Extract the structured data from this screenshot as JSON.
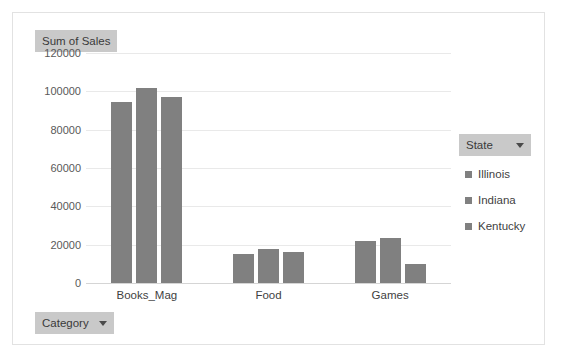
{
  "value_field": {
    "label": "Sum of Sales"
  },
  "category_field": {
    "label": "Category",
    "icon": "chevron-down-icon"
  },
  "legend_field": {
    "label": "State",
    "icon": "chevron-down-icon"
  },
  "colors": {
    "bar": "#808080",
    "field_button_bg": "#c9c9c9",
    "gridline": "#e9e9e9",
    "frame_border": "#e2e2e2",
    "axis_text": "#595959"
  },
  "chart_data": {
    "type": "bar",
    "title": "Sum of Sales",
    "xlabel": "Category",
    "ylabel": "Sum of Sales",
    "ylim": [
      0,
      120000
    ],
    "ytick_step": 20000,
    "yticks": [
      "120000",
      "100000",
      "80000",
      "60000",
      "40000",
      "20000",
      "0"
    ],
    "ytick_values": [
      120000,
      100000,
      80000,
      60000,
      40000,
      20000,
      0
    ],
    "grid": true,
    "legend_position": "right",
    "legend_title": "State",
    "categories": [
      "Books_Mag",
      "Food",
      "Games"
    ],
    "series": [
      {
        "name": "Illinois",
        "values": [
          94500,
          15000,
          22000
        ]
      },
      {
        "name": "Indiana",
        "values": [
          101500,
          18000,
          23500
        ]
      },
      {
        "name": "Kentucky",
        "values": [
          97000,
          16000,
          10000
        ]
      }
    ]
  }
}
